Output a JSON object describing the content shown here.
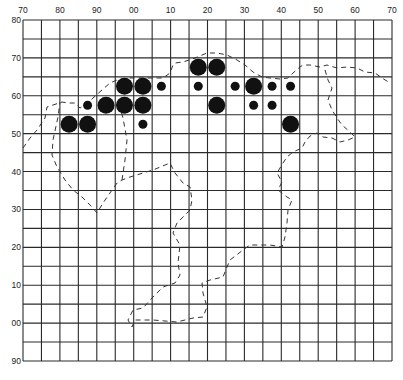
{
  "chart_data": {
    "type": "scatter",
    "title": "",
    "xlabel": "",
    "ylabel": "",
    "x_tick_labels": [
      "70",
      "80",
      "90",
      "00",
      "10",
      "20",
      "30",
      "40",
      "50",
      "60",
      "70"
    ],
    "y_tick_labels": [
      "80",
      "70",
      "60",
      "50",
      "40",
      "30",
      "20",
      "10",
      "00",
      "90"
    ],
    "grid": true,
    "grid_columns": 20,
    "grid_rows": 18,
    "plot_area_px": {
      "left": 23,
      "top": 20,
      "right": 392,
      "bottom": 361
    },
    "colors": {
      "grid": "#2a2a2a",
      "dots": "#111111",
      "outline": "#333333",
      "labels": "#222222"
    },
    "legend": null,
    "size_classes": {
      "large": 8.5,
      "small": 4.5
    },
    "points": [
      {
        "col": 2.5,
        "row": 5.5,
        "size": "large"
      },
      {
        "col": 3.5,
        "row": 5.5,
        "size": "large"
      },
      {
        "col": 3.5,
        "row": 4.5,
        "size": "small"
      },
      {
        "col": 4.5,
        "row": 4.5,
        "size": "large"
      },
      {
        "col": 5.5,
        "row": 4.5,
        "size": "large"
      },
      {
        "col": 6.5,
        "row": 4.5,
        "size": "large"
      },
      {
        "col": 5.5,
        "row": 3.5,
        "size": "large"
      },
      {
        "col": 6.5,
        "row": 3.5,
        "size": "large"
      },
      {
        "col": 6.5,
        "row": 5.5,
        "size": "small"
      },
      {
        "col": 7.5,
        "row": 3.5,
        "size": "small"
      },
      {
        "col": 9.5,
        "row": 2.5,
        "size": "large"
      },
      {
        "col": 10.5,
        "row": 2.5,
        "size": "large"
      },
      {
        "col": 9.5,
        "row": 3.5,
        "size": "small"
      },
      {
        "col": 10.5,
        "row": 4.5,
        "size": "large"
      },
      {
        "col": 11.5,
        "row": 3.5,
        "size": "small"
      },
      {
        "col": 12.5,
        "row": 3.5,
        "size": "large"
      },
      {
        "col": 12.5,
        "row": 4.5,
        "size": "small"
      },
      {
        "col": 13.5,
        "row": 3.5,
        "size": "small"
      },
      {
        "col": 13.5,
        "row": 4.5,
        "size": "small"
      },
      {
        "col": 14.5,
        "row": 3.5,
        "size": "small"
      },
      {
        "col": 14.5,
        "row": 5.5,
        "size": "large"
      }
    ],
    "outline_paths_px": [
      [
        [
          23,
          148
        ],
        [
          30,
          138
        ],
        [
          37,
          130
        ],
        [
          45,
          118
        ],
        [
          47,
          107
        ],
        [
          53,
          105
        ],
        [
          62,
          102
        ],
        [
          68,
          103
        ],
        [
          75,
          103
        ],
        [
          80,
          108
        ],
        [
          87,
          104
        ],
        [
          93,
          98
        ],
        [
          102,
          90
        ],
        [
          110,
          83
        ],
        [
          117,
          80
        ],
        [
          130,
          78
        ],
        [
          140,
          78
        ],
        [
          152,
          78
        ],
        [
          163,
          78
        ],
        [
          170,
          73
        ],
        [
          173,
          65
        ],
        [
          175,
          63
        ],
        [
          183,
          62
        ],
        [
          195,
          58
        ],
        [
          207,
          53
        ],
        [
          217,
          53
        ],
        [
          227,
          55
        ],
        [
          237,
          60
        ],
        [
          245,
          65
        ],
        [
          253,
          72
        ],
        [
          262,
          77
        ],
        [
          270,
          78
        ],
        [
          280,
          79
        ],
        [
          288,
          78
        ],
        [
          293,
          73
        ],
        [
          300,
          67
        ],
        [
          303,
          65
        ],
        [
          310,
          65
        ],
        [
          320,
          67
        ],
        [
          327,
          65
        ],
        [
          337,
          68
        ],
        [
          347,
          67
        ],
        [
          357,
          68
        ],
        [
          365,
          72
        ],
        [
          375,
          73
        ],
        [
          382,
          78
        ],
        [
          390,
          83
        ]
      ],
      [
        [
          325,
          70
        ],
        [
          328,
          80
        ],
        [
          332,
          88
        ],
        [
          328,
          100
        ],
        [
          332,
          110
        ],
        [
          337,
          118
        ],
        [
          342,
          125
        ],
        [
          350,
          132
        ],
        [
          355,
          137
        ],
        [
          348,
          140
        ],
        [
          340,
          142
        ],
        [
          332,
          138
        ],
        [
          323,
          137
        ],
        [
          317,
          133
        ],
        [
          310,
          136
        ],
        [
          305,
          142
        ],
        [
          302,
          148
        ],
        [
          293,
          152
        ],
        [
          287,
          157
        ],
        [
          283,
          163
        ],
        [
          277,
          173
        ],
        [
          282,
          182
        ],
        [
          278,
          190
        ],
        [
          287,
          197
        ],
        [
          292,
          200
        ],
        [
          288,
          210
        ],
        [
          287,
          223
        ],
        [
          285,
          237
        ],
        [
          282,
          247
        ],
        [
          270,
          245
        ],
        [
          263,
          245
        ],
        [
          250,
          245
        ],
        [
          243,
          250
        ],
        [
          230,
          260
        ],
        [
          227,
          267
        ],
        [
          223,
          277
        ],
        [
          210,
          280
        ],
        [
          202,
          283
        ],
        [
          203,
          293
        ],
        [
          207,
          307
        ],
        [
          203,
          317
        ],
        [
          193,
          318
        ],
        [
          177,
          322
        ],
        [
          153,
          320
        ],
        [
          135,
          320
        ],
        [
          132,
          327
        ],
        [
          128,
          320
        ],
        [
          133,
          310
        ],
        [
          143,
          308
        ],
        [
          153,
          297
        ],
        [
          163,
          287
        ],
        [
          175,
          283
        ],
        [
          180,
          275
        ],
        [
          178,
          263
        ],
        [
          180,
          245
        ],
        [
          173,
          233
        ],
        [
          177,
          223
        ],
        [
          180,
          220
        ],
        [
          190,
          210
        ],
        [
          192,
          200
        ],
        [
          190,
          187
        ],
        [
          183,
          183
        ],
        [
          175,
          173
        ],
        [
          170,
          163
        ],
        [
          153,
          170
        ],
        [
          143,
          173
        ],
        [
          130,
          177
        ],
        [
          122,
          180
        ],
        [
          117,
          183
        ],
        [
          110,
          193
        ],
        [
          103,
          203
        ],
        [
          97,
          213
        ],
        [
          92,
          207
        ],
        [
          82,
          197
        ],
        [
          73,
          190
        ],
        [
          65,
          180
        ],
        [
          57,
          167
        ],
        [
          52,
          155
        ],
        [
          53,
          140
        ],
        [
          58,
          117
        ],
        [
          60,
          102
        ]
      ],
      [
        [
          122,
          180
        ],
        [
          125,
          160
        ],
        [
          127,
          140
        ],
        [
          123,
          118
        ],
        [
          118,
          100
        ]
      ]
    ]
  }
}
